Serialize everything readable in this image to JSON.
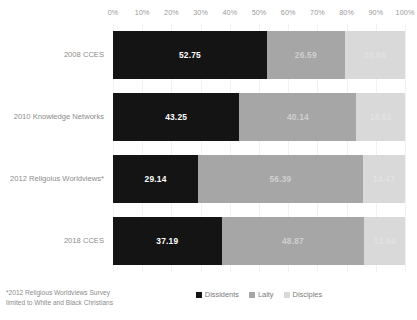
{
  "chart_data": {
    "type": "bar",
    "orientation": "horizontal",
    "stacked": true,
    "stack_mode": "percent",
    "title": "",
    "xlabel": "",
    "ylabel": "",
    "xlim": [
      0,
      100
    ],
    "grid": true,
    "legend_position": "bottom",
    "tick_labels": [
      "0%",
      "10%",
      "20%",
      "30%",
      "40%",
      "50%",
      "60%",
      "70%",
      "80%",
      "90%",
      "100%"
    ],
    "tick_values": [
      0,
      10,
      20,
      30,
      40,
      50,
      60,
      70,
      80,
      90,
      100
    ],
    "categories": [
      "2008 CCES",
      "2010 Knowledge Networks",
      "2012 Religoius Worldviews*",
      "2018 CCES"
    ],
    "series": [
      {
        "name": "Dissidents",
        "color": "#141414",
        "values": [
          52.75,
          43.25,
          29.14,
          37.19
        ],
        "labels": [
          "52.75",
          "43.25",
          "29.14",
          "37.19"
        ]
      },
      {
        "name": "Laity",
        "color": "#a6a6a6",
        "values": [
          26.59,
          40.14,
          56.39,
          48.87
        ],
        "labels": [
          "26.59",
          "40.14",
          "56.39",
          "48.87"
        ]
      },
      {
        "name": "Disciples",
        "color": "#d9d9d9",
        "values": [
          20.66,
          16.61,
          14.47,
          13.94
        ],
        "labels": [
          "20.66",
          "16.61",
          "14.47",
          "13.94"
        ]
      }
    ],
    "annotations": [
      "*2012 Religious Worldviews Survey limited to White and Black Christians"
    ]
  },
  "footnote": {
    "text": "*2012 Religious Worldviews Survey limited to White and Black Christians"
  }
}
